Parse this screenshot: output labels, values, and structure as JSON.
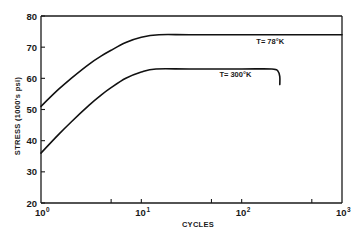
{
  "chart_data": {
    "type": "line",
    "title": "",
    "xlabel": "CYCLES",
    "ylabel": "STRESS (1000's psi)",
    "xscale": "log",
    "xlim": [
      1,
      1000
    ],
    "ylim": [
      20,
      80
    ],
    "grid": false,
    "legend": null,
    "x_ticks": [
      {
        "value": 1,
        "base": "10",
        "exp": "0"
      },
      {
        "value": 10,
        "base": "10",
        "exp": "1"
      },
      {
        "value": 100,
        "base": "10",
        "exp": "2"
      },
      {
        "value": 1000,
        "base": "10",
        "exp": "3"
      }
    ],
    "x_minor_ticks": [
      5,
      50,
      500
    ],
    "y_ticks": [
      {
        "value": 20,
        "label": "20"
      },
      {
        "value": 30,
        "label": "30"
      },
      {
        "value": 40,
        "label": "40"
      },
      {
        "value": 50,
        "label": "50"
      },
      {
        "value": 60,
        "label": "60"
      },
      {
        "value": 70,
        "label": "70"
      },
      {
        "value": 80,
        "label": "80"
      }
    ],
    "series": [
      {
        "name": "T= 78°K",
        "label": "T= 78°K",
        "label_at": {
          "x": 140,
          "y": 71
        },
        "points": [
          [
            1,
            51
          ],
          [
            1.5,
            56.5
          ],
          [
            2,
            60
          ],
          [
            3,
            64.5
          ],
          [
            4,
            67.2
          ],
          [
            5,
            69
          ],
          [
            7,
            71.5
          ],
          [
            10,
            73.2
          ],
          [
            15,
            74
          ],
          [
            30,
            74
          ],
          [
            100,
            74
          ],
          [
            1000,
            74
          ]
        ]
      },
      {
        "name": "T= 300°K",
        "label": "T= 300°K",
        "label_at": {
          "x": 60,
          "y": 60.5
        },
        "points": [
          [
            1,
            36
          ],
          [
            1.5,
            42
          ],
          [
            2,
            46
          ],
          [
            3,
            51.3
          ],
          [
            4,
            54.7
          ],
          [
            5,
            57
          ],
          [
            7,
            60
          ],
          [
            10,
            62
          ],
          [
            14,
            63
          ],
          [
            30,
            63
          ],
          [
            100,
            63
          ],
          [
            200,
            63
          ],
          [
            230,
            62.3
          ],
          [
            240,
            60.5
          ],
          [
            240,
            58
          ]
        ]
      }
    ]
  }
}
